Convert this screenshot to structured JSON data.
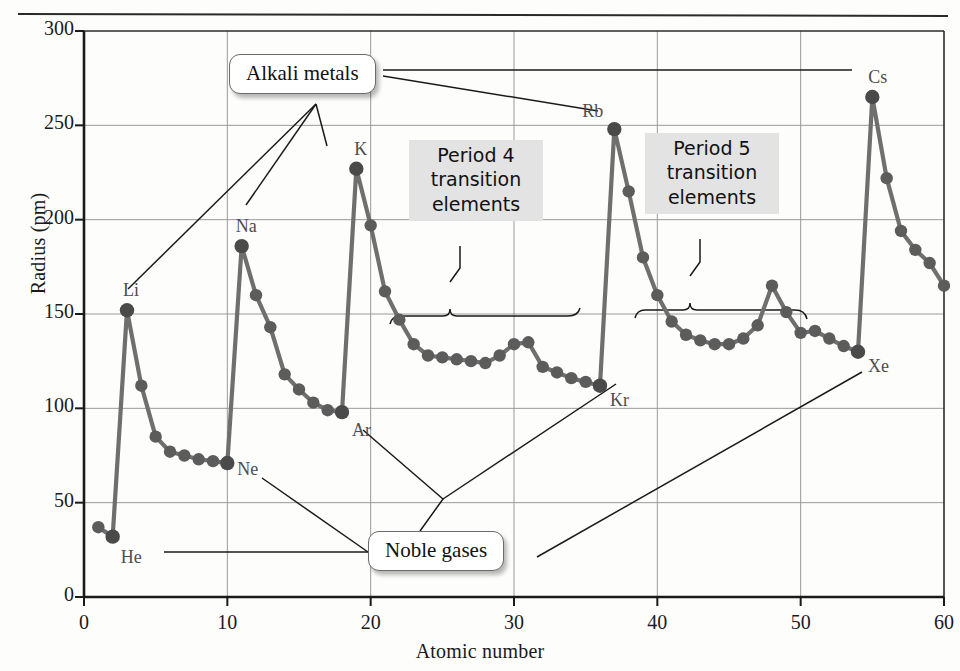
{
  "figure": {
    "title": "",
    "xlabel": "Atomic number",
    "ylabel": "Radius (pm)"
  },
  "axis": {
    "y_ticks": [
      "0",
      "50",
      "100",
      "150",
      "200",
      "250",
      "300"
    ],
    "x_ticks": [
      "0",
      "10",
      "20",
      "30",
      "40",
      "50",
      "60"
    ]
  },
  "callouts": {
    "alkali": "Alkali metals",
    "noble": "Noble gases",
    "period4": "Period 4\ntransition\nelements",
    "period5": "Period 5\ntransition\nelements"
  },
  "point_labels": [
    {
      "text": "He",
      "z": 2,
      "r": 32,
      "dx": 8,
      "dy": 10
    },
    {
      "text": "Li",
      "z": 3,
      "r": 152,
      "dx": -4,
      "dy": -30
    },
    {
      "text": "Ne",
      "z": 10,
      "r": 71,
      "dx": 10,
      "dy": -4
    },
    {
      "text": "Na",
      "z": 11,
      "r": 186,
      "dx": -6,
      "dy": -30
    },
    {
      "text": "Ar",
      "z": 18,
      "r": 98,
      "dx": 10,
      "dy": 8
    },
    {
      "text": "K",
      "z": 19,
      "r": 227,
      "dx": -2,
      "dy": -30
    },
    {
      "text": "Kr",
      "z": 36,
      "r": 112,
      "dx": 10,
      "dy": 4
    },
    {
      "text": "Rb",
      "z": 37,
      "r": 248,
      "dx": -32,
      "dy": -28
    },
    {
      "text": "Xe",
      "z": 54,
      "r": 130,
      "dx": 10,
      "dy": 4
    },
    {
      "text": "Cs",
      "z": 55,
      "r": 265,
      "dx": -4,
      "dy": -30
    }
  ],
  "chart_data": {
    "type": "line",
    "title": "",
    "xlabel": "Atomic number",
    "ylabel": "Radius (pm)",
    "xlim": [
      0,
      60
    ],
    "ylim": [
      0,
      300
    ],
    "xticks": [
      0,
      10,
      20,
      30,
      40,
      50,
      60
    ],
    "yticks": [
      0,
      50,
      100,
      150,
      200,
      250,
      300
    ],
    "grid": true,
    "legend": "none",
    "marker": "circle",
    "line_color": "#6b6b6b",
    "marker_color": "#5c5c5c",
    "x": [
      1,
      2,
      3,
      4,
      5,
      6,
      7,
      8,
      9,
      10,
      11,
      12,
      13,
      14,
      15,
      16,
      17,
      18,
      19,
      20,
      21,
      22,
      23,
      24,
      25,
      26,
      27,
      28,
      29,
      30,
      31,
      32,
      33,
      34,
      35,
      36,
      37,
      38,
      39,
      40,
      41,
      42,
      43,
      44,
      45,
      46,
      47,
      48,
      49,
      50,
      51,
      52,
      53,
      54,
      55,
      56,
      57,
      58,
      59,
      60
    ],
    "values": [
      37,
      32,
      152,
      112,
      85,
      77,
      75,
      73,
      72,
      71,
      186,
      160,
      143,
      118,
      110,
      103,
      99,
      98,
      227,
      197,
      162,
      147,
      134,
      128,
      127,
      126,
      125,
      124,
      128,
      134,
      135,
      122,
      119,
      116,
      114,
      112,
      248,
      215,
      180,
      160,
      146,
      139,
      136,
      134,
      134,
      137,
      144,
      165,
      151,
      140,
      141,
      137,
      133,
      130,
      265,
      222,
      194,
      184,
      177,
      165
    ],
    "series": [
      {
        "name": "Atomic radius",
        "elements": [
          "H",
          "He",
          "Li",
          "Be",
          "B",
          "C",
          "N",
          "O",
          "F",
          "Ne",
          "Na",
          "Mg",
          "Al",
          "Si",
          "P",
          "S",
          "Cl",
          "Ar",
          "K",
          "Ca",
          "Sc",
          "Ti",
          "V",
          "Cr",
          "Mn",
          "Fe",
          "Co",
          "Ni",
          "Cu",
          "Zn",
          "Ga",
          "Ge",
          "As",
          "Se",
          "Br",
          "Kr",
          "Rb",
          "Sr",
          "Y",
          "Zr",
          "Nb",
          "Mo",
          "Tc",
          "Ru",
          "Rh",
          "Pd",
          "Ag",
          "Cd",
          "In",
          "Sn",
          "Sb",
          "Te",
          "I",
          "Xe",
          "Cs",
          "Ba",
          "La",
          "Ce",
          "Pr",
          "Nd"
        ],
        "values": [
          37,
          32,
          152,
          112,
          85,
          77,
          75,
          73,
          72,
          71,
          186,
          160,
          143,
          118,
          110,
          103,
          99,
          98,
          227,
          197,
          162,
          147,
          134,
          128,
          127,
          126,
          125,
          124,
          128,
          134,
          135,
          122,
          119,
          116,
          114,
          112,
          248,
          215,
          180,
          160,
          146,
          139,
          136,
          134,
          134,
          137,
          144,
          165,
          151,
          140,
          141,
          137,
          133,
          130,
          265,
          222,
          194,
          184,
          177,
          165
        ]
      }
    ],
    "annotations": [
      {
        "label": "Alkali metals",
        "points": [
          3,
          11,
          19,
          37,
          55
        ]
      },
      {
        "label": "Noble gases",
        "points": [
          2,
          10,
          18,
          36,
          54
        ]
      },
      {
        "label": "Period 4 transition elements",
        "range": [
          21,
          30
        ]
      },
      {
        "label": "Period 5 transition elements",
        "range": [
          39,
          48
        ]
      }
    ]
  }
}
